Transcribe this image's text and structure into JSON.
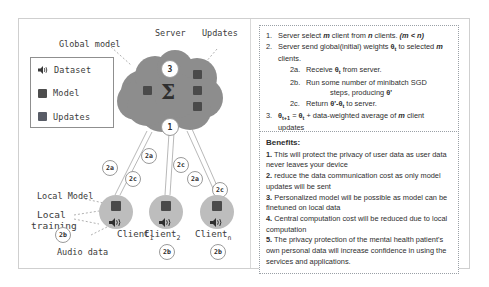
{
  "figure": {
    "diagram": {
      "legend": {
        "title": "legend",
        "items": [
          {
            "icon": "speaker-icon",
            "label": "Dataset"
          },
          {
            "icon": "square-icon",
            "label": "Model"
          },
          {
            "icon": "square-icon",
            "label": "Updates"
          }
        ]
      },
      "annotations": {
        "global_model": "Global model",
        "server": "Server",
        "updates": "Updates",
        "local_model": "Local Model",
        "local_training_line1": "Local",
        "local_training_line2": "training",
        "audio_data": "Audio data"
      },
      "server": {
        "sigma_symbol": "Σ",
        "badge_top": "3",
        "badge_bottom": "1"
      },
      "clients": [
        {
          "name": "Client",
          "subscript": "1",
          "badge_a": "2a",
          "badge_b": "2b",
          "badge_c": "2c"
        },
        {
          "name": "Client",
          "subscript": "2",
          "badge_a": "2a",
          "badge_b": "2b",
          "badge_c": "2c"
        },
        {
          "name": "Client",
          "subscript": "n",
          "badge_a": "2a",
          "badge_b": "2b",
          "badge_c": "2c"
        }
      ]
    },
    "algorithm": {
      "steps": [
        {
          "num": "1.",
          "text": "Server select m client from n clients. (m < n)"
        },
        {
          "num": "2.",
          "text": "Server send global(initial) weights θt to selected m clients."
        }
      ],
      "substeps": [
        {
          "num": "2a.",
          "text": "Receive θt from server."
        },
        {
          "num": "2b.",
          "text": "Run some number of minibatch SGD"
        },
        {
          "num": "",
          "text": "steps, producing θ'"
        },
        {
          "num": "2c.",
          "text": "Return θ'-θt to server."
        }
      ],
      "final_step": {
        "num": "3.",
        "text": "θt+1 = θt + data-weighted average of m client updates"
      }
    },
    "benefits": {
      "title": "Benefits:",
      "items": [
        {
          "num": "1.",
          "text": "This will protect the privacy of user data as user data never leaves your device"
        },
        {
          "num": "2.",
          "text": "reduce the data communication cost as only model updates will be sent"
        },
        {
          "num": "3.",
          "text": "Personalized model will be possible as model can be finetuned on local data"
        },
        {
          "num": "4.",
          "text": "Central computation cost will be reduced due to local computation"
        },
        {
          "num": "5.",
          "text": "The privacy protection of the mental health patient's own personal data will increase confidence in using the services and applications."
        }
      ]
    },
    "colors": {
      "cloud": "#8d8d8d",
      "client": "#bdbdbd",
      "square": "#4a4a4a",
      "updates_square": "#585c66",
      "frame_border": "#cfcfcf",
      "panel_border": "#9aa0a6",
      "text": "#2d2d2d"
    }
  }
}
